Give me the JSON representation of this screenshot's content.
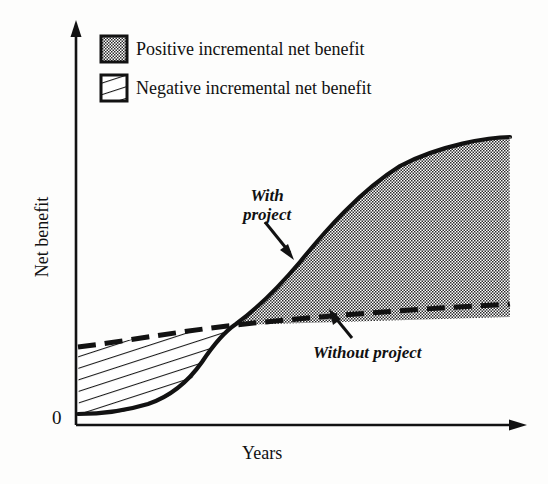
{
  "chart_data": {
    "type": "area",
    "title": "",
    "xlabel": "Years",
    "ylabel": "Net benefit",
    "origin_label": "0",
    "grid": false,
    "axis_style": "arrowed open axes, no tick marks, no numeric scale",
    "xlim": [
      0,
      100
    ],
    "ylim": [
      0,
      100
    ],
    "legend": {
      "position": "top-left inside plot",
      "entries": [
        {
          "label": "Positive incremental net benefit",
          "swatch": "dotted-stipple",
          "meaning": "area between With project and Without project after crossover"
        },
        {
          "label": "Negative incremental net benefit",
          "swatch": "diagonal-hatch",
          "meaning": "area between Without project and With project before crossover"
        }
      ]
    },
    "annotations": [
      {
        "text": "With project",
        "style": "italic",
        "pointer": "arrow pointing down-right to the solid curve"
      },
      {
        "text": "Without project",
        "style": "italic",
        "pointer": "arrow pointing up-left to the dashed line"
      }
    ],
    "series": [
      {
        "name": "With project",
        "line_style": "solid",
        "shape": "S-curve (logistic): low and flat at first, steep rise in the middle years, then steady near-linear growth",
        "points": [
          [
            0,
            8
          ],
          [
            6,
            9
          ],
          [
            12,
            11
          ],
          [
            18,
            14
          ],
          [
            24,
            18
          ],
          [
            30,
            24
          ],
          [
            36,
            33
          ],
          [
            42,
            44
          ],
          [
            48,
            54
          ],
          [
            54,
            61
          ],
          [
            60,
            66
          ],
          [
            68,
            72
          ],
          [
            76,
            78
          ],
          [
            85,
            85
          ],
          [
            100,
            96
          ]
        ]
      },
      {
        "name": "Without project",
        "line_style": "dashed",
        "shape": "gentle, almost straight slow upward drift",
        "points": [
          [
            0,
            25
          ],
          [
            15,
            29
          ],
          [
            30,
            33
          ],
          [
            45,
            38
          ],
          [
            60,
            43
          ],
          [
            75,
            48
          ],
          [
            88,
            52
          ],
          [
            100,
            56
          ]
        ]
      }
    ],
    "crossover": {
      "description": "the two curves intersect where the negative incremental benefit ends and the positive incremental benefit begins",
      "x": 42,
      "y": 44
    }
  }
}
